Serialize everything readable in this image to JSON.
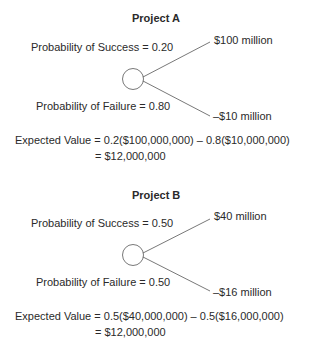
{
  "projects": [
    {
      "title": "Project A",
      "success_label": "Probability of Success = 0.20",
      "failure_label": "Probability of Failure = 0.80",
      "success_outcome": "$100 million",
      "failure_outcome": "–$10 million",
      "ev_line1": "Expected Value = 0.2($100,000,000) – 0.8($10,000,000)",
      "ev_line2": "= $12,000,000"
    },
    {
      "title": "Project B",
      "success_label": "Probability of Success = 0.50",
      "failure_label": "Probability of Failure = 0.50",
      "success_outcome": "$40 million",
      "failure_outcome": "–$16 million",
      "ev_line1": "Expected Value = 0.5($40,000,000) – 0.5($16,000,000)",
      "ev_line2": "= $12,000,000"
    }
  ]
}
